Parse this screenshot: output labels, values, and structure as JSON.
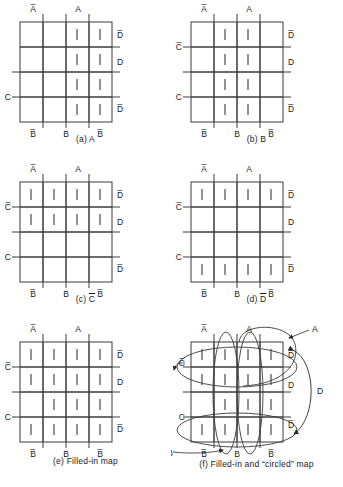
{
  "figure": {
    "variables": [
      "A",
      "B",
      "C",
      "D"
    ],
    "grid": {
      "rows": 4,
      "cols": 4
    },
    "line_color": "#3a3a3a",
    "tally_color": "#3a3a3a",
    "text_color": "#1a1a1a"
  },
  "axis_labels": {
    "top": [
      "A-bar",
      "A"
    ],
    "top_text": [
      "A",
      "A"
    ],
    "top_overline": [
      true,
      false
    ],
    "bottom": [
      "B-bar",
      "B",
      "B-bar"
    ],
    "bottom_text": [
      "B",
      "B",
      "B"
    ],
    "bottom_overline": [
      true,
      false,
      true
    ],
    "left": [
      "C-bar",
      "C"
    ],
    "left_text": [
      "C",
      "C"
    ],
    "left_overline": [
      true,
      false
    ],
    "right": [
      "D-bar",
      "D",
      "D-bar"
    ],
    "right_text": [
      "D",
      "D",
      "D"
    ],
    "right_overline": [
      true,
      false,
      true
    ]
  },
  "panels": [
    {
      "id": "a",
      "caption_prefix": "(a)",
      "caption_term": "A",
      "caption_overline": false,
      "caption_full": "(a) A",
      "show_left_cbar": false,
      "marks": [
        [
          0,
          0,
          1,
          1
        ],
        [
          0,
          0,
          1,
          1
        ],
        [
          0,
          0,
          1,
          1
        ],
        [
          0,
          0,
          1,
          1
        ]
      ]
    },
    {
      "id": "b",
      "caption_prefix": "(b)",
      "caption_term": "B",
      "caption_overline": false,
      "caption_full": "(b) B",
      "show_left_cbar": true,
      "marks": [
        [
          0,
          1,
          1,
          0
        ],
        [
          0,
          1,
          1,
          0
        ],
        [
          0,
          1,
          1,
          0
        ],
        [
          0,
          1,
          1,
          0
        ]
      ]
    },
    {
      "id": "c",
      "caption_prefix": "(c)",
      "caption_term": "C",
      "caption_overline": true,
      "caption_full": "(c) C̅",
      "show_left_cbar": true,
      "marks": [
        [
          1,
          1,
          1,
          1
        ],
        [
          1,
          1,
          1,
          1
        ],
        [
          0,
          0,
          0,
          0
        ],
        [
          0,
          0,
          0,
          0
        ]
      ]
    },
    {
      "id": "d",
      "caption_prefix": "(d)",
      "caption_term": "D",
      "caption_overline": true,
      "caption_full": "(d) D̅",
      "show_left_cbar": true,
      "marks": [
        [
          1,
          1,
          1,
          1
        ],
        [
          0,
          0,
          0,
          0
        ],
        [
          0,
          0,
          0,
          0
        ],
        [
          1,
          1,
          1,
          1
        ]
      ]
    },
    {
      "id": "e",
      "caption_prefix": "(e)",
      "caption_term": "Filled-in map",
      "caption_overline": false,
      "caption_full": "(e) Filled-in map",
      "show_left_cbar": true,
      "marks": [
        [
          1,
          1,
          1,
          1
        ],
        [
          1,
          1,
          1,
          1
        ],
        [
          0,
          1,
          1,
          1
        ],
        [
          1,
          1,
          1,
          1
        ]
      ]
    },
    {
      "id": "f",
      "caption_prefix": "(f)",
      "caption_term": "Filled-in and “circled” map",
      "caption_overline": false,
      "caption_full": "(f) Filled-in and “circled” map",
      "show_left_cbar": true,
      "marks": [
        [
          1,
          1,
          1,
          1
        ],
        [
          1,
          1,
          1,
          1
        ],
        [
          0,
          1,
          1,
          1
        ],
        [
          1,
          1,
          1,
          1
        ]
      ],
      "callouts": [
        {
          "name": "A",
          "text": "A",
          "overline": false
        },
        {
          "name": "C-bar",
          "text": "C",
          "overline": true
        },
        {
          "name": "B",
          "text": "B",
          "overline": false
        },
        {
          "name": "D",
          "text": "D",
          "overline": false
        }
      ],
      "loops": [
        {
          "name": "loop-a",
          "kind": "vertical-ellipse"
        },
        {
          "name": "loop-a2",
          "kind": "vertical-ellipse"
        },
        {
          "name": "loop-cbar",
          "kind": "horizontal-ellipse"
        },
        {
          "name": "loop-b",
          "kind": "horizontal-ellipse"
        },
        {
          "name": "loop-d-bracket",
          "kind": "bracket"
        }
      ]
    }
  ]
}
